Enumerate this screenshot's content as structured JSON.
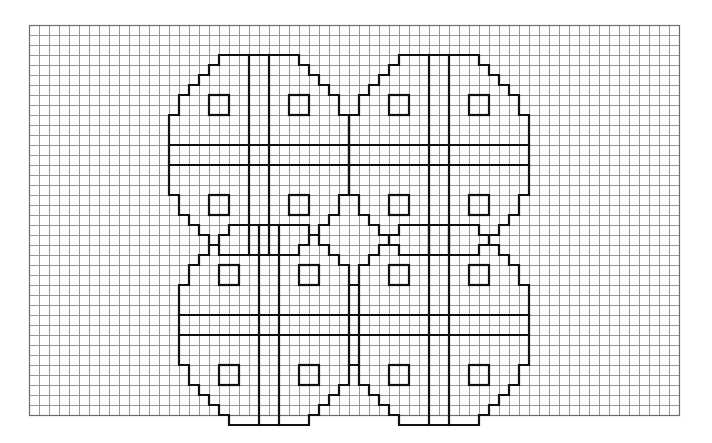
{
  "page": {
    "width": 712,
    "height": 443,
    "background_color": "#ffffff"
  },
  "grid": {
    "name": "graph-paper-grid",
    "origin_x": 29,
    "origin_y": 25,
    "cell_size": 10,
    "columns": 65,
    "rows": 39,
    "line_color": "#8d8d90",
    "line_width": 0.9,
    "border_color": "#6e6e72",
    "border_width": 1.2
  },
  "motif": {
    "name": "wheel-cross-medallion",
    "description": "Stepped octagonal medallion with a double-line central cross and four small open squares, one per quadrant.",
    "size_cells": 20,
    "stroke_color": "#111111",
    "stroke_width": 2.2,
    "outline_steps": [
      [
        6,
        0
      ],
      [
        14,
        0
      ],
      [
        14,
        1
      ],
      [
        15,
        1
      ],
      [
        15,
        2
      ],
      [
        16,
        2
      ],
      [
        16,
        3
      ],
      [
        17,
        3
      ],
      [
        17,
        4
      ],
      [
        18,
        4
      ],
      [
        18,
        6
      ],
      [
        19,
        6
      ],
      [
        19,
        14
      ],
      [
        18,
        14
      ],
      [
        18,
        16
      ],
      [
        17,
        16
      ],
      [
        17,
        17
      ],
      [
        16,
        17
      ],
      [
        16,
        18
      ],
      [
        15,
        18
      ],
      [
        15,
        19
      ],
      [
        14,
        19
      ],
      [
        14,
        20
      ],
      [
        6,
        20
      ],
      [
        6,
        19
      ],
      [
        5,
        19
      ],
      [
        5,
        18
      ],
      [
        4,
        18
      ],
      [
        4,
        17
      ],
      [
        3,
        17
      ],
      [
        3,
        16
      ],
      [
        2,
        16
      ],
      [
        2,
        14
      ],
      [
        1,
        14
      ],
      [
        1,
        6
      ],
      [
        2,
        6
      ],
      [
        2,
        4
      ],
      [
        3,
        4
      ],
      [
        3,
        3
      ],
      [
        4,
        3
      ],
      [
        4,
        2
      ],
      [
        5,
        2
      ],
      [
        5,
        1
      ],
      [
        6,
        1
      ]
    ],
    "cross": {
      "name": "central-double-cross",
      "vertical_left_cell": 9,
      "vertical_right_cell": 11,
      "horizontal_top_cell": 9,
      "horizontal_bottom_cell": 11,
      "vertical_span_cells": [
        0,
        20
      ],
      "horizontal_span_cells": [
        1,
        19
      ]
    },
    "quadrant_squares": {
      "name": "quadrant-square",
      "size_cells": 2,
      "positions": [
        [
          5,
          4
        ],
        [
          13,
          4
        ],
        [
          5,
          14
        ],
        [
          13,
          14
        ]
      ]
    }
  },
  "motifs": [
    {
      "name": "medallion-top-left",
      "label": "Top left medallion",
      "col": 13,
      "row": 3
    },
    {
      "name": "medallion-top-right",
      "label": "Top right medallion",
      "col": 31,
      "row": 3
    },
    {
      "name": "medallion-bottom-left",
      "label": "Bottom left medallion",
      "col": 14,
      "row": 20
    },
    {
      "name": "medallion-bottom-right",
      "label": "Bottom right medallion",
      "col": 31,
      "row": 20
    }
  ]
}
